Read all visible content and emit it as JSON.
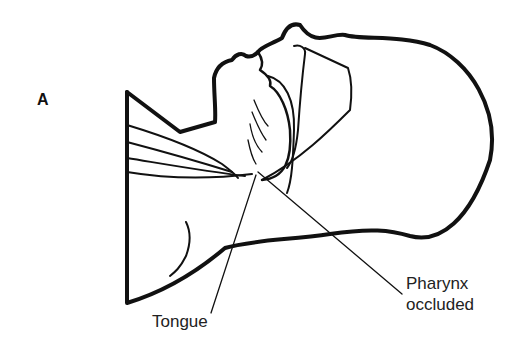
{
  "figure": {
    "panel_label": "A",
    "labels": {
      "tongue": "Tongue",
      "pharynx_line1": "Pharynx",
      "pharynx_line2": "occluded"
    },
    "colors": {
      "ink": "#111111",
      "background": "#ffffff"
    }
  }
}
